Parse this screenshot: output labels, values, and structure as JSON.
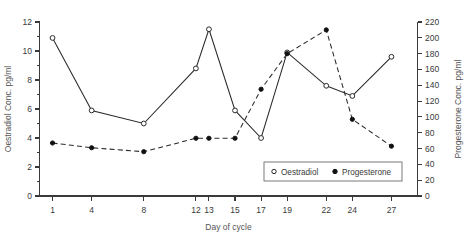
{
  "chart_data": {
    "type": "line",
    "title": "",
    "xlabel": "Day of cycle",
    "x": [
      1,
      4,
      8,
      12,
      13,
      15,
      17,
      19,
      22,
      24,
      27
    ],
    "xticklabels": [
      "1",
      "4",
      "8",
      "12",
      "13",
      "15",
      "17",
      "19",
      "22",
      "24",
      "27"
    ],
    "grid": false,
    "legend_position": "inside-bottom-right",
    "axes": {
      "left": {
        "label": "Oestradiol Conc. pg/ml",
        "lim": [
          0,
          12
        ],
        "ticks": [
          0,
          2,
          4,
          6,
          8,
          10,
          12
        ],
        "ticklabels": [
          "0",
          "2",
          "4",
          "6",
          "8",
          "10",
          "12"
        ],
        "minor_ticks": [
          1,
          3,
          5,
          7,
          9,
          11
        ]
      },
      "right": {
        "label": "Progesterone Conc. pg/ml",
        "lim": [
          0,
          220
        ],
        "ticks": [
          0,
          20,
          40,
          60,
          80,
          100,
          120,
          140,
          160,
          180,
          200,
          220
        ],
        "ticklabels": [
          "0",
          "20",
          "40",
          "60",
          "80",
          "100",
          "120",
          "140",
          "160",
          "180",
          "200",
          "220"
        ]
      }
    },
    "series": [
      {
        "name": "Oestradiol",
        "axis": "left",
        "marker": "open-circle",
        "linestyle": "solid",
        "color": "#2a2a2a",
        "values": [
          10.9,
          5.9,
          5.0,
          8.8,
          11.5,
          5.9,
          4.0,
          9.9,
          7.6,
          6.9,
          9.6
        ]
      },
      {
        "name": "Progesterone",
        "axis": "right",
        "marker": "filled-circle",
        "linestyle": "dashed",
        "color": "#111111",
        "values": [
          67,
          61,
          56,
          73,
          73,
          73,
          135,
          180,
          210,
          97,
          63
        ]
      }
    ],
    "legend": [
      {
        "label": "Oestradiol",
        "marker": "open-circle"
      },
      {
        "label": "Progesterone",
        "marker": "filled-circle"
      }
    ]
  }
}
